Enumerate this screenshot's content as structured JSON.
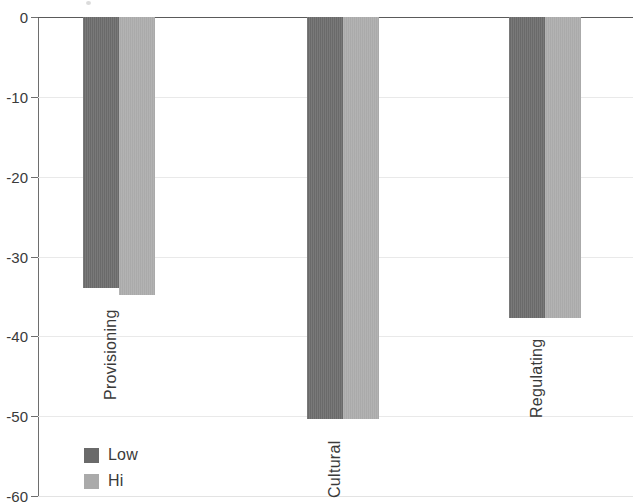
{
  "chart_data": {
    "type": "bar",
    "title": "",
    "subtitle": "",
    "xlabel": "",
    "ylabel": "",
    "categories": [
      "Provisioning",
      "Cultural",
      "Regulating"
    ],
    "series": [
      {
        "name": "Low",
        "color": "#6a6a6a",
        "values": [
          -34.0,
          -50.3,
          -37.7
        ]
      },
      {
        "name": "Hi",
        "color": "#aaaaaa",
        "values": [
          -34.8,
          -50.3,
          -37.7
        ]
      }
    ],
    "ylim": [
      -60,
      0
    ],
    "ytick_labels": [
      "0",
      "-10",
      "-20",
      "-30",
      "-40",
      "-50",
      "-60"
    ],
    "ytick_values": [
      0,
      -10,
      -20,
      -30,
      -40,
      -50,
      -60
    ],
    "grid": true,
    "grid_axis": "y",
    "legend_position": "inside-lower-left",
    "orientation": "vertical",
    "bar_group_mode": "grouped",
    "annotations": []
  },
  "axis": {
    "y_ticks": [
      {
        "label": "0",
        "value": 0
      },
      {
        "label": "-10",
        "value": -10
      },
      {
        "label": "-20",
        "value": -20
      },
      {
        "label": "-30",
        "value": -30
      },
      {
        "label": "-40",
        "value": -40
      },
      {
        "label": "-50",
        "value": -50
      },
      {
        "label": "-60",
        "value": -60
      }
    ]
  },
  "legend": {
    "items": [
      {
        "label": "Low",
        "color": "#6a6a6a"
      },
      {
        "label": "Hi",
        "color": "#aaaaaa"
      }
    ]
  },
  "categories": [
    {
      "label": "Provisioning"
    },
    {
      "label": "Cultural"
    },
    {
      "label": "Regulating"
    }
  ],
  "colors": {
    "series_low": "#6a6a6a",
    "series_hi": "#aaaaaa",
    "gridline": "#e9e9e9",
    "axis": "#6e6e6e",
    "text": "#3a3a3a",
    "background": "#ffffff"
  }
}
